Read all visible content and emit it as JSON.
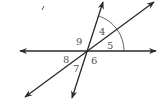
{
  "diagram": {
    "type": "intersecting-lines-angles",
    "colors": {
      "lines": "#2a2a2a",
      "labels": "#555555",
      "arc": "#666666",
      "background": "#ffffff"
    },
    "intersection": {
      "x": 87,
      "y": 51
    },
    "lines": [
      {
        "name": "horizontal-line",
        "x1": 20,
        "y1": 51,
        "x2": 156,
        "y2": 51
      },
      {
        "name": "diagonal-line",
        "x1": 25,
        "y1": 97,
        "x2": 154,
        "y2": 2
      },
      {
        "name": "steep-line",
        "x1": 72,
        "y1": 98,
        "x2": 103,
        "y2": 2
      }
    ],
    "angle_labels": [
      {
        "text": "4",
        "x": 99,
        "y": 35
      },
      {
        "text": "5",
        "x": 107,
        "y": 49
      },
      {
        "text": "9",
        "x": 76,
        "y": 45
      },
      {
        "text": "8",
        "x": 63,
        "y": 63
      },
      {
        "text": "6",
        "x": 91,
        "y": 64
      },
      {
        "text": "7",
        "x": 73,
        "y": 72
      }
    ],
    "arc": {
      "from_angle_label": "horizontal",
      "to": "steep-line",
      "radius": 37
    },
    "stray_mark": "/"
  }
}
